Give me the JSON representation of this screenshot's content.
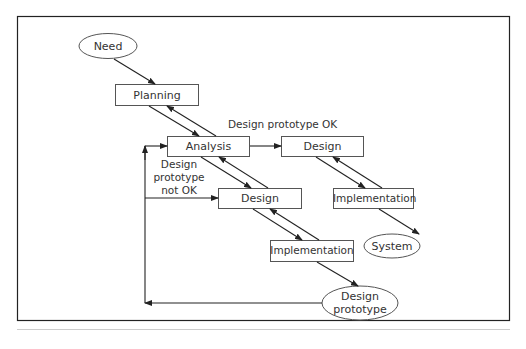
{
  "diagram": {
    "type": "flow",
    "nodes": {
      "need": {
        "label": "Need",
        "shape": "ellipse"
      },
      "planning": {
        "label": "Planning",
        "shape": "rect"
      },
      "analysis": {
        "label": "Analysis",
        "shape": "rect"
      },
      "design_final": {
        "label": "Design",
        "shape": "rect"
      },
      "implementation_final": {
        "label": "Implementation",
        "shape": "rect"
      },
      "system": {
        "label": "System",
        "shape": "ellipse"
      },
      "design_proto": {
        "label": "Design",
        "shape": "rect"
      },
      "implementation_proto": {
        "label": "Implementation",
        "shape": "rect"
      },
      "design_prototype": {
        "label_line1": "Design",
        "label_line2": "prototype",
        "shape": "ellipse"
      }
    },
    "edge_labels": {
      "ok": "Design prototype OK",
      "not_ok_line1": "Design",
      "not_ok_line2": "prototype",
      "not_ok_line3": "not OK"
    },
    "colors": {
      "stroke": "#333333",
      "text": "#333333",
      "frame": "#222222",
      "background": "#ffffff"
    }
  }
}
